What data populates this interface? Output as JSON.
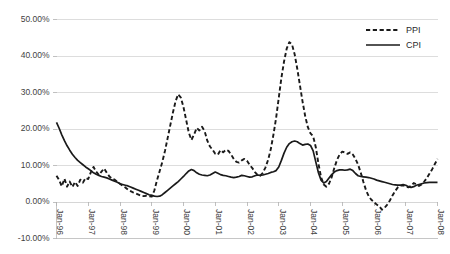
{
  "chart_data": {
    "type": "line",
    "title": "",
    "subtitle": "",
    "xlabel": "",
    "ylabel": "",
    "ylim": [
      -10,
      50
    ],
    "ytick_values": [
      -10,
      0,
      10,
      20,
      30,
      40,
      50
    ],
    "ytick_labels": [
      "-10.00%",
      "0.00%",
      "10.00%",
      "20.00%",
      "30.00%",
      "40.00%",
      "50.00%"
    ],
    "xtick_labels": [
      "Jan-96",
      "Jan-97",
      "Jan-98",
      "Jan-99",
      "Jan-00",
      "Jan-01",
      "Jan-02",
      "Jan-03",
      "Jan-04",
      "Jan-05",
      "Jan-06",
      "Jan-07",
      "Jan-08"
    ],
    "x_start": "Jan-96",
    "x_end": "Jan-08",
    "x_points_per_tick": 12,
    "grid": true,
    "legend_position": "top-right",
    "series": [
      {
        "name": "PPI",
        "style": "dashed",
        "color": "#1a1a1a",
        "values": [
          7.2,
          6.0,
          4.3,
          6.4,
          4.2,
          5.6,
          4.1,
          5.5,
          4.4,
          6.1,
          5.3,
          6.6,
          6.3,
          8.2,
          9.6,
          8.3,
          7.4,
          8.3,
          9.2,
          8.0,
          7.0,
          6.4,
          6.1,
          5.5,
          5.0,
          4.4,
          4.0,
          3.4,
          3.0,
          2.6,
          2.3,
          2.0,
          1.7,
          1.6,
          1.7,
          1.6,
          1.5,
          3.2,
          6.0,
          8.5,
          11.0,
          14.0,
          17.5,
          21.0,
          24.5,
          27.6,
          29.5,
          28.6,
          26.0,
          22.5,
          19.0,
          17.0,
          18.5,
          20.3,
          19.6,
          20.6,
          19.4,
          16.8,
          15.2,
          14.3,
          13.2,
          13.0,
          14.2,
          13.6,
          14.3,
          14.0,
          13.0,
          11.8,
          11.0,
          10.8,
          11.4,
          11.8,
          11.3,
          10.2,
          9.3,
          8.2,
          7.4,
          7.2,
          8.0,
          9.5,
          11.6,
          14.5,
          18.5,
          23.0,
          28.5,
          34.0,
          38.5,
          42.0,
          43.8,
          43.2,
          40.5,
          36.5,
          32.0,
          27.5,
          23.5,
          20.5,
          18.8,
          18.0,
          15.0,
          10.5,
          6.8,
          4.8,
          4.2,
          5.0,
          6.8,
          9.3,
          11.5,
          13.0,
          13.8,
          13.6,
          13.2,
          13.6,
          13.0,
          11.8,
          10.2,
          8.0,
          5.5,
          3.2,
          1.6,
          0.6,
          0.0,
          -0.7,
          -1.2,
          -2.1,
          -1.6,
          -0.7,
          0.4,
          1.8,
          3.0,
          4.0,
          4.5,
          4.6,
          4.3,
          4.0,
          4.4,
          5.2,
          4.8,
          4.4,
          4.8,
          5.6,
          6.6,
          7.8,
          9.0,
          10.4,
          11.8
        ]
      },
      {
        "name": "CPI",
        "style": "solid",
        "color": "#1a1a1a",
        "values": [
          21.8,
          20.2,
          18.4,
          16.8,
          15.4,
          14.2,
          13.1,
          12.2,
          11.4,
          10.8,
          10.2,
          9.6,
          9.1,
          8.6,
          8.0,
          7.6,
          7.3,
          7.0,
          6.8,
          6.6,
          6.3,
          6.0,
          5.7,
          5.4,
          5.0,
          4.8,
          4.6,
          4.4,
          4.1,
          3.8,
          3.5,
          3.2,
          2.9,
          2.6,
          2.3,
          2.0,
          1.8,
          1.6,
          1.5,
          1.6,
          2.0,
          2.6,
          3.2,
          3.8,
          4.4,
          5.0,
          5.6,
          6.3,
          7.0,
          7.8,
          8.5,
          8.9,
          8.6,
          8.0,
          7.6,
          7.4,
          7.3,
          7.2,
          7.4,
          7.8,
          8.2,
          7.9,
          7.5,
          7.3,
          7.2,
          7.0,
          6.8,
          6.7,
          6.8,
          7.0,
          7.3,
          7.2,
          7.0,
          6.8,
          6.9,
          7.2,
          7.4,
          7.3,
          7.4,
          7.6,
          7.8,
          8.1,
          8.3,
          8.6,
          9.6,
          11.4,
          13.4,
          15.0,
          16.0,
          16.5,
          16.7,
          16.5,
          16.0,
          15.6,
          15.8,
          15.9,
          15.5,
          14.0,
          11.0,
          8.0,
          6.0,
          5.2,
          5.6,
          6.6,
          7.5,
          8.2,
          8.6,
          8.8,
          8.8,
          8.7,
          8.8,
          9.0,
          8.6,
          7.8,
          7.2,
          7.0,
          6.9,
          6.8,
          6.7,
          6.5,
          6.3,
          6.0,
          5.8,
          5.6,
          5.4,
          5.2,
          5.0,
          4.8,
          4.7,
          4.6,
          4.6,
          4.8,
          4.6,
          4.2,
          4.0,
          4.2,
          4.6,
          4.8,
          5.0,
          5.2,
          5.3,
          5.4,
          5.4,
          5.4,
          5.4
        ]
      }
    ]
  },
  "legend": {
    "items": [
      {
        "label": "PPI",
        "style": "dashed"
      },
      {
        "label": "CPI",
        "style": "solid"
      }
    ]
  }
}
